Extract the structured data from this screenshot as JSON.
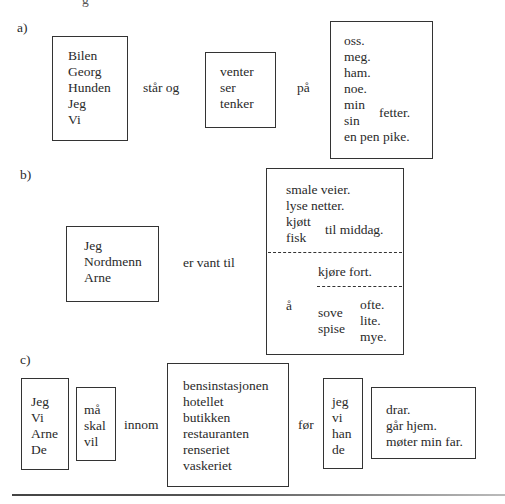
{
  "top_partial_text": "g",
  "sections": {
    "a": {
      "label": "a)",
      "subjects": [
        "Bilen",
        "Georg",
        "Hunden",
        "Jeg",
        "Vi"
      ],
      "connector1": "står og",
      "verbs": [
        "venter",
        "ser",
        "tenker"
      ],
      "connector2": "på",
      "objects_simple": [
        "oss.",
        "meg.",
        "ham.",
        "noe."
      ],
      "possessives": [
        "min",
        "sin"
      ],
      "possessive_noun": "fetter.",
      "objects_last": "en pen pike."
    },
    "b": {
      "label": "b)",
      "subjects": [
        "Jeg",
        "Nordmenn",
        "Arne"
      ],
      "connector": "er vant til",
      "nouns": [
        "smale veier.",
        "lyse netter."
      ],
      "foods": [
        "kjøtt",
        "fisk"
      ],
      "food_suffix": "til middag.",
      "infinitive_marker": "å",
      "verb_phrase": "kjøre fort.",
      "verbs": [
        "sove",
        "spise"
      ],
      "adverbs": [
        "ofte.",
        "lite.",
        "mye."
      ]
    },
    "c": {
      "label": "c)",
      "subjects": [
        "Jeg",
        "Vi",
        "Arne",
        "De"
      ],
      "modals": [
        "må",
        "skal",
        "vil"
      ],
      "connector1": "innom",
      "places": [
        "bensinstasjonen",
        "hotellet",
        "butikken",
        "restauranten",
        "renseriet",
        "vaskeriet"
      ],
      "connector2": "før",
      "pronouns": [
        "jeg",
        "vi",
        "han",
        "de"
      ],
      "endings": [
        "drar.",
        "går hjem.",
        "møter min far."
      ]
    }
  }
}
